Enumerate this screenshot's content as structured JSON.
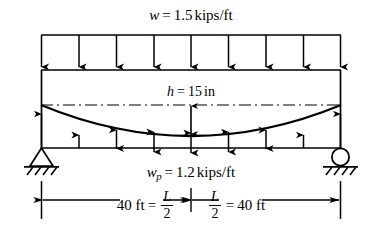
{
  "figure": {
    "labels": {
      "top_load_symbol": "w",
      "top_load_eq": "=",
      "top_load_value": "1.5",
      "top_load_units": "kips/ft",
      "top_load_full": "w = 1.5 kips/ft",
      "depth_symbol": "h",
      "depth_eq": "=",
      "depth_value": "15",
      "depth_units": "in",
      "depth_full": "h = 15 in",
      "tendon_load_symbol": "w",
      "tendon_load_subscript": "p",
      "tendon_load_eq": "=",
      "tendon_load_value": "1.2",
      "tendon_load_units": "kips/ft",
      "tendon_load_full": "wp = 1.2 kips/ft"
    },
    "dimensions": {
      "left_value": "40 ft",
      "left_eq": "=",
      "left_frac_num": "L",
      "left_frac_den": "2",
      "right_frac_num": "L",
      "right_frac_den": "2",
      "right_eq": "=",
      "right_value": "40 ft",
      "left_full": "40 ft = L/2",
      "right_full": "L/2 = 40 ft",
      "total_span": "80 ft"
    },
    "supports": {
      "left_type": "pin",
      "right_type": "roller"
    },
    "counts": {
      "top_load_arrows": 9,
      "tendon_load_arrows": 9
    },
    "colors": {
      "line": "#000000",
      "background": "#ffffff"
    }
  }
}
